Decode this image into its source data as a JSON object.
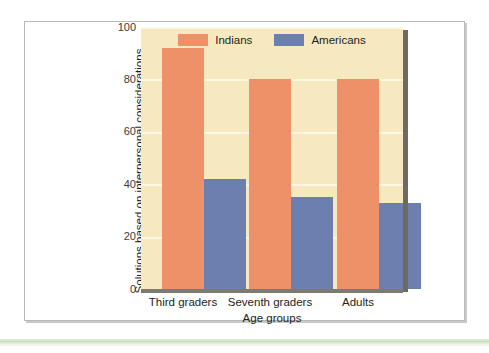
{
  "figure": {
    "background_color": "#ffffff",
    "frame_border_color": "#b9b9b9",
    "accent_rule_color": "#cfe0c2"
  },
  "chart_data": {
    "type": "bar",
    "title": "",
    "subtitle": "",
    "xlabel": "Age groups",
    "ylabel": "Solutions based on interpersonal considerations (percent)",
    "ylabel_line1": "Solutions based on interpersonal considerations",
    "ylabel_line2": "(percent)",
    "categories": [
      "Third graders",
      "Seventh graders",
      "Adults"
    ],
    "series": [
      {
        "name": "Indians",
        "color": "#ef9168",
        "values": [
          92,
          80,
          80
        ]
      },
      {
        "name": "Americans",
        "color": "#6d7fae",
        "values": [
          42,
          35,
          33
        ]
      }
    ],
    "ylim": [
      0,
      100
    ],
    "yticks": [
      0,
      20,
      40,
      60,
      80,
      100
    ],
    "ytick_labels": [
      "0",
      "20",
      "40",
      "60",
      "80",
      "100"
    ],
    "grid": true,
    "grid_axis": "y",
    "grid_color": "#fcf6e2",
    "plot_background": "#f6e9c0",
    "legend_position": "top-center",
    "legend_entries": [
      "Indians",
      "Americans"
    ]
  },
  "legend": {
    "items": [
      {
        "label": "Indians",
        "swatch": "legend-swatch-indians"
      },
      {
        "label": "Americans",
        "swatch": "legend-swatch-americans"
      }
    ]
  },
  "axes": {
    "y_ticks": [
      "100",
      "80",
      "60",
      "40",
      "20",
      "0"
    ],
    "x_ticks": [
      "Third graders",
      "Seventh graders",
      "Adults"
    ]
  }
}
